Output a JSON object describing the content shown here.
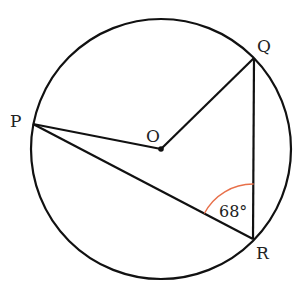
{
  "diagram": {
    "circle": {
      "cx": 161,
      "cy": 149,
      "r": 130,
      "stroke": "#111111"
    },
    "center": {
      "label": "O",
      "x": 161,
      "y": 149,
      "label_x": 153,
      "label_y": 142
    },
    "points": [
      {
        "id": "P",
        "label": "P",
        "x": 33,
        "y": 124,
        "label_x": 16,
        "label_y": 127
      },
      {
        "id": "Q",
        "label": "Q",
        "x": 254,
        "y": 58,
        "label_x": 264,
        "label_y": 51
      },
      {
        "id": "R",
        "label": "R",
        "x": 253,
        "y": 239,
        "label_x": 262,
        "label_y": 259
      }
    ],
    "segments": [
      {
        "from": "P",
        "to": "O"
      },
      {
        "from": "O",
        "to": "Q"
      },
      {
        "from": "Q",
        "to": "R"
      },
      {
        "from": "P",
        "to": "R"
      }
    ],
    "angle": {
      "vertex": "R",
      "value": "68°",
      "arc_color": "#e8704a",
      "label_x": 232,
      "label_y": 216
    }
  }
}
